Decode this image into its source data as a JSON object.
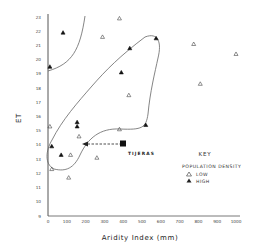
{
  "chart_data": {
    "type": "scatter",
    "title": "",
    "xlabel": "Aridity Index (mm)",
    "ylabel": "ET",
    "xlim": [
      0,
      1000
    ],
    "ylim": [
      9,
      23
    ],
    "x_ticks": [
      "0",
      "100",
      "200",
      "300",
      "400",
      "500",
      "600",
      "700",
      "800",
      "900",
      "1000"
    ],
    "y_ticks": [
      "9",
      "10",
      "11",
      "12",
      "13",
      "14",
      "15",
      "16",
      "17",
      "18",
      "19",
      "20",
      "21",
      "22",
      "23"
    ],
    "grid": false,
    "legend": {
      "position": "right-middle",
      "title": "KEY",
      "subtitle": "POPULATION DENSITY",
      "entries": [
        {
          "symbol": "open-triangle",
          "label": "LOW"
        },
        {
          "symbol": "filled-triangle",
          "label": "HIGH"
        }
      ]
    },
    "series": [
      {
        "name": "LOW",
        "marker": "open-triangle",
        "points": [
          {
            "x": 290,
            "y": 21.6
          },
          {
            "x": 380,
            "y": 22.9
          },
          {
            "x": 775,
            "y": 21.1
          },
          {
            "x": 1000,
            "y": 20.4
          },
          {
            "x": 810,
            "y": 18.3
          },
          {
            "x": 430,
            "y": 17.5
          },
          {
            "x": 10,
            "y": 15.3
          },
          {
            "x": 380,
            "y": 15.1
          },
          {
            "x": 165,
            "y": 14.6
          },
          {
            "x": 120,
            "y": 13.3
          },
          {
            "x": 260,
            "y": 13.1
          },
          {
            "x": 20,
            "y": 12.3
          },
          {
            "x": 110,
            "y": 11.7
          }
        ]
      },
      {
        "name": "HIGH",
        "marker": "filled-triangle",
        "points": [
          {
            "x": 80,
            "y": 21.9
          },
          {
            "x": 10,
            "y": 19.5
          },
          {
            "x": 435,
            "y": 20.8
          },
          {
            "x": 575,
            "y": 21.5
          },
          {
            "x": 390,
            "y": 19.1
          },
          {
            "x": 155,
            "y": 15.6
          },
          {
            "x": 155,
            "y": 15.3
          },
          {
            "x": 520,
            "y": 15.4
          },
          {
            "x": 20,
            "y": 13.9
          },
          {
            "x": 70,
            "y": 13.3
          }
        ]
      }
    ],
    "annotations": [
      {
        "type": "filled-square",
        "label": "TIJERAS",
        "x": 410,
        "y": 14.3
      },
      {
        "type": "dashed-arrow",
        "from": {
          "x": 410,
          "y": 14.3
        },
        "to": {
          "x": 180,
          "y": 14.3
        }
      },
      {
        "type": "boundary-curve",
        "description": "upper-left curve enclosing high ET / low aridity region"
      },
      {
        "type": "boundary-loop",
        "description": "closed loop enclosing central cluster of points"
      }
    ]
  }
}
